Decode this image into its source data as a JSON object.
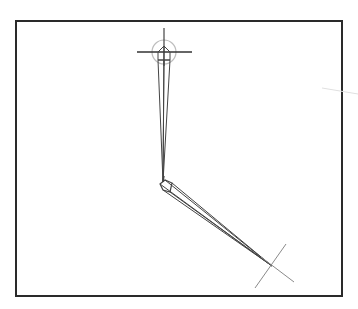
{
  "viewport": {
    "width": 358,
    "height": 309,
    "background": "#ffffff",
    "frame": {
      "x": 16,
      "y": 21,
      "width": 326,
      "height": 275,
      "stroke": "#2a2a2a",
      "stroke_width": 2
    }
  },
  "colors": {
    "bone": "#444444",
    "handle": "#333333",
    "circle": "#bdbdbd",
    "stray_line": "#e0e0e0"
  },
  "scene": {
    "top_handle": {
      "center": [
        164,
        52
      ],
      "circle_radius": 12,
      "horizontal": [
        [
          137,
          52
        ],
        [
          192,
          52
        ]
      ],
      "vertical": [
        [
          164,
          28
        ],
        [
          164,
          66
        ]
      ],
      "icon": "crosshair-circle-icon"
    },
    "upper_bone": {
      "head": [
        164,
        52
      ],
      "tail": [
        163,
        182
      ],
      "head_shape": [
        [
          158,
          60
        ],
        [
          158,
          52
        ],
        [
          164,
          46
        ],
        [
          170,
          52
        ],
        [
          170,
          60
        ]
      ],
      "icon": "bone-octahedral"
    },
    "lower_bone": {
      "head": [
        163,
        182
      ],
      "tail": [
        272,
        266
      ],
      "joint_shape": [
        [
          160,
          184
        ],
        [
          165,
          180
        ],
        [
          172,
          183
        ],
        [
          170,
          192
        ],
        [
          163,
          190
        ]
      ],
      "icon": "bone-octahedral"
    },
    "bottom_handle": {
      "center": [
        272,
        266
      ],
      "line_a": [
        [
          255,
          288
        ],
        [
          286,
          244
        ]
      ],
      "line_b": [
        [
          261,
          257
        ],
        [
          294,
          282
        ]
      ],
      "icon": "crosshair-x-icon"
    },
    "stray_line": [
      [
        322,
        88
      ],
      [
        358,
        94
      ]
    ]
  }
}
